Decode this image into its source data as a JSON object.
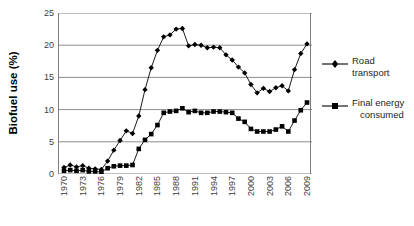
{
  "chart_data": {
    "type": "line",
    "title": "",
    "xlabel": "",
    "ylabel": "Biofuel use (%)",
    "ylim": [
      0,
      25
    ],
    "yticks": [
      0,
      5,
      10,
      15,
      20,
      25
    ],
    "grid": "horizontal",
    "legend_position": "right",
    "x": [
      1970,
      1971,
      1972,
      1973,
      1974,
      1975,
      1976,
      1977,
      1978,
      1979,
      1980,
      1981,
      1982,
      1983,
      1984,
      1985,
      1986,
      1987,
      1988,
      1989,
      1990,
      1991,
      1992,
      1993,
      1994,
      1995,
      1996,
      1997,
      1998,
      1999,
      2000,
      2001,
      2002,
      2003,
      2004,
      2005,
      2006,
      2007,
      2008,
      2009
    ],
    "xtick_labels": [
      1970,
      1973,
      1976,
      1979,
      1982,
      1985,
      1988,
      1991,
      1994,
      1997,
      2000,
      2003,
      2006,
      2009
    ],
    "series": [
      {
        "name": "Road transport",
        "marker": "diamond",
        "color": "#000000",
        "values": [
          1.0,
          1.4,
          1.1,
          1.3,
          0.9,
          0.8,
          0.7,
          2.0,
          3.7,
          5.2,
          6.7,
          6.3,
          9.0,
          13.1,
          16.5,
          19.2,
          21.3,
          21.6,
          22.5,
          22.6,
          19.9,
          20.1,
          20.0,
          19.6,
          19.7,
          19.6,
          18.5,
          17.7,
          16.6,
          15.7,
          13.9,
          12.6,
          13.3,
          12.8,
          13.4,
          13.7,
          12.9,
          16.2,
          18.7,
          20.2
        ]
      },
      {
        "name": "Final energy consumed",
        "marker": "square",
        "color": "#000000",
        "values": [
          0.5,
          0.6,
          0.5,
          0.6,
          0.4,
          0.4,
          0.3,
          0.9,
          1.2,
          1.3,
          1.3,
          1.4,
          3.9,
          5.3,
          6.2,
          7.6,
          9.5,
          9.7,
          9.8,
          10.2,
          9.6,
          9.8,
          9.5,
          9.5,
          9.7,
          9.7,
          9.6,
          9.5,
          8.6,
          8.1,
          7.0,
          6.6,
          6.6,
          6.6,
          6.9,
          7.4,
          6.6,
          8.3,
          9.9,
          11.1
        ]
      }
    ]
  },
  "legend": [
    {
      "label": "Road transport",
      "label_line1": "Road transport",
      "label_line2": ""
    },
    {
      "label": "Final energy consumed",
      "label_line1": "Final energy",
      "label_line2": "consumed"
    }
  ],
  "axis": {
    "y_title": "Biofuel use (%)"
  }
}
